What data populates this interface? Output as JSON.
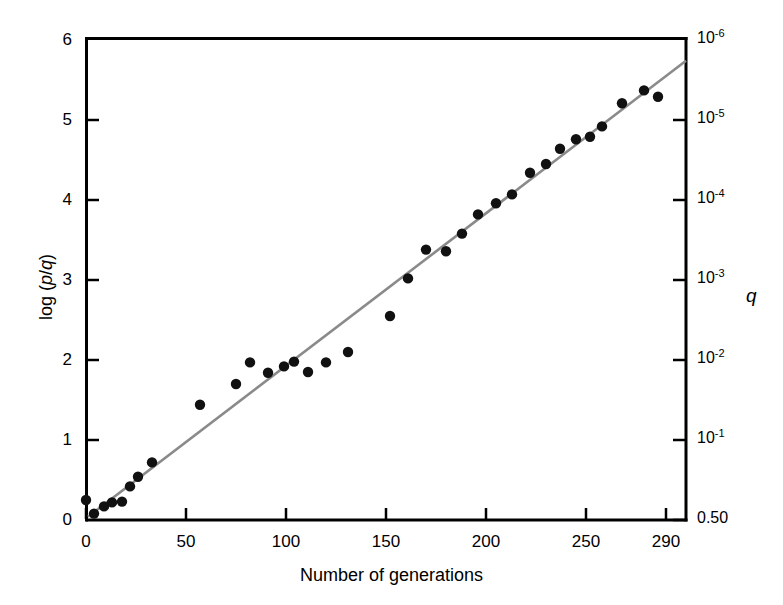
{
  "chart_data": {
    "type": "scatter",
    "title": "",
    "xlabel": "Number of generations",
    "ylabel": "log (p/q)",
    "y2label": "q",
    "xlim": [
      0,
      300
    ],
    "ylim": [
      0,
      6
    ],
    "grid": false,
    "legend": "none",
    "xticks": [
      {
        "value": 0,
        "label": "0"
      },
      {
        "value": 50,
        "label": "50"
      },
      {
        "value": 100,
        "label": "100"
      },
      {
        "value": 150,
        "label": "150"
      },
      {
        "value": 200,
        "label": "200"
      },
      {
        "value": 250,
        "label": "250"
      },
      {
        "value": 290,
        "label": "290"
      }
    ],
    "yticks": [
      {
        "value": 0,
        "label": "0"
      },
      {
        "value": 1,
        "label": "1"
      },
      {
        "value": 2,
        "label": "2"
      },
      {
        "value": 3,
        "label": "3"
      },
      {
        "value": 4,
        "label": "4"
      },
      {
        "value": 5,
        "label": "5"
      },
      {
        "value": 6,
        "label": "6"
      }
    ],
    "y2ticks": [
      {
        "value": 0,
        "base": "0.50",
        "exp": ""
      },
      {
        "value": 1,
        "base": "10",
        "exp": "-1"
      },
      {
        "value": 2,
        "base": "10",
        "exp": "-2"
      },
      {
        "value": 3,
        "base": "10",
        "exp": "-3"
      },
      {
        "value": 4,
        "base": "10",
        "exp": "-4"
      },
      {
        "value": 5,
        "base": "10",
        "exp": "-5"
      },
      {
        "value": 6,
        "base": "10",
        "exp": "-6"
      }
    ],
    "series": [
      {
        "name": "observed",
        "marker": "filled-circle",
        "color": "#111111",
        "points": [
          {
            "x": 0,
            "y": 0.25
          },
          {
            "x": 4,
            "y": 0.08
          },
          {
            "x": 9,
            "y": 0.17
          },
          {
            "x": 13,
            "y": 0.22
          },
          {
            "x": 18,
            "y": 0.23
          },
          {
            "x": 22,
            "y": 0.42
          },
          {
            "x": 26,
            "y": 0.54
          },
          {
            "x": 33,
            "y": 0.72
          },
          {
            "x": 57,
            "y": 1.44
          },
          {
            "x": 75,
            "y": 1.7
          },
          {
            "x": 82,
            "y": 1.97
          },
          {
            "x": 91,
            "y": 1.84
          },
          {
            "x": 99,
            "y": 1.92
          },
          {
            "x": 104,
            "y": 1.98
          },
          {
            "x": 111,
            "y": 1.85
          },
          {
            "x": 120,
            "y": 1.97
          },
          {
            "x": 131,
            "y": 2.1
          },
          {
            "x": 152,
            "y": 2.55
          },
          {
            "x": 161,
            "y": 3.02
          },
          {
            "x": 170,
            "y": 3.38
          },
          {
            "x": 180,
            "y": 3.36
          },
          {
            "x": 188,
            "y": 3.58
          },
          {
            "x": 196,
            "y": 3.82
          },
          {
            "x": 205,
            "y": 3.96
          },
          {
            "x": 213,
            "y": 4.07
          },
          {
            "x": 222,
            "y": 4.34
          },
          {
            "x": 230,
            "y": 4.45
          },
          {
            "x": 237,
            "y": 4.64
          },
          {
            "x": 245,
            "y": 4.76
          },
          {
            "x": 252,
            "y": 4.79
          },
          {
            "x": 258,
            "y": 4.92
          },
          {
            "x": 268,
            "y": 5.21
          },
          {
            "x": 279,
            "y": 5.37
          },
          {
            "x": 286,
            "y": 5.29
          }
        ]
      }
    ],
    "fit_line": {
      "name": "regression-line",
      "color": "#8a8a8a",
      "x0": 1,
      "y0": 0.04,
      "x1": 300,
      "y1": 5.74
    }
  }
}
